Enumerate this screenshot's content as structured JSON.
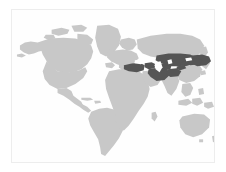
{
  "figure": {
    "type": "world-locator-map",
    "projection": "equirectangular",
    "title": "",
    "caption": ""
  },
  "canvas": {
    "width": 226,
    "height": 172,
    "background_color": "#ffffff"
  },
  "frame": {
    "x": 11,
    "y": 9,
    "width": 204,
    "height": 154,
    "border_color": "#ededed",
    "border_width": 1,
    "fill_color": "#fefefe"
  },
  "legend": {
    "visible": false,
    "entries": [
      {
        "name": "highlighted-region",
        "label": "",
        "color": "#555555"
      },
      {
        "name": "other-land",
        "label": "",
        "color": "#c8c8c8"
      },
      {
        "name": "ocean",
        "label": "",
        "color": "#fefefe"
      }
    ]
  },
  "colors": {
    "ocean": "#fefefe",
    "land": "#c8c8c8",
    "highlight": "#555555",
    "border": "#ededed",
    "page": "#ffffff"
  },
  "regions": {
    "highlighted": [
      "Turkey",
      "Georgia",
      "Armenia",
      "Azerbaijan",
      "Iran",
      "Turkmenistan",
      "Uzbekistan",
      "Tajikistan",
      "Kyrgyzstan",
      "Kazakhstan",
      "Afghanistan",
      "Mongolia"
    ],
    "base_land": [
      "North America",
      "South America",
      "Greenland",
      "Europe",
      "Africa",
      "Asia",
      "Australia",
      "Southeast Asia"
    ]
  },
  "chart_data": {
    "type": "map",
    "title": "",
    "xlabel": "",
    "ylabel": "",
    "legend_position": "none",
    "grid": false,
    "xlim": [
      -180,
      180
    ],
    "ylim": [
      -60,
      84
    ],
    "categories": [
      "Turkey",
      "Georgia",
      "Armenia",
      "Azerbaijan",
      "Iran",
      "Turkmenistan",
      "Uzbekistan",
      "Tajikistan",
      "Kyrgyzstan",
      "Kazakhstan",
      "Afghanistan",
      "Mongolia"
    ],
    "values": [
      1,
      1,
      1,
      1,
      1,
      1,
      1,
      1,
      1,
      1,
      1,
      1
    ],
    "series": [
      {
        "name": "highlighted",
        "values": [
          1,
          1,
          1,
          1,
          1,
          1,
          1,
          1,
          1,
          1,
          1,
          1
        ]
      }
    ],
    "value_colors": {
      "1": "#555555",
      "0": "#c8c8c8"
    }
  }
}
